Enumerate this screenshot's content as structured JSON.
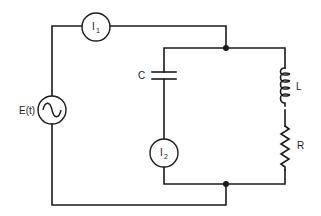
{
  "diagram": {
    "type": "circuit",
    "colors": {
      "wire": "#1a1a1a",
      "background": "#ffffff"
    },
    "components": [
      {
        "id": "source",
        "kind": "ac-voltage-source",
        "label": "E(t)"
      },
      {
        "id": "ammeter1",
        "kind": "ammeter",
        "label": "I",
        "subscript": "1"
      },
      {
        "id": "capacitor",
        "kind": "capacitor",
        "label": "C"
      },
      {
        "id": "ammeter2",
        "kind": "ammeter",
        "label": "I",
        "subscript": "2"
      },
      {
        "id": "inductor",
        "kind": "inductor",
        "label": "L"
      },
      {
        "id": "resistor",
        "kind": "resistor",
        "label": "R"
      }
    ],
    "junctions": [
      "top-junction",
      "bottom-junction"
    ]
  }
}
